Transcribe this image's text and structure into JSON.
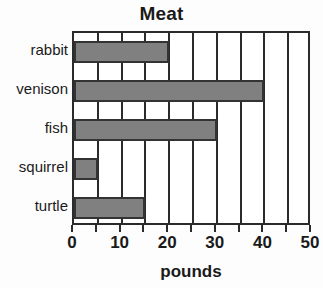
{
  "chart_data": {
    "type": "bar",
    "orientation": "horizontal",
    "title": "Meat",
    "xlabel": "pounds",
    "ylabel": "",
    "categories": [
      "rabbit",
      "venison",
      "fish",
      "squirrel",
      "turtle"
    ],
    "values": [
      20,
      40,
      30,
      5,
      15
    ],
    "xlim": [
      0,
      50
    ],
    "xticks": [
      0,
      10,
      20,
      30,
      40,
      50
    ],
    "xtick_labels": [
      "0",
      "10",
      "20",
      "30",
      "40",
      "50"
    ],
    "minor_tick_step": 5,
    "gridlines": [
      0,
      5,
      10,
      15,
      20,
      25,
      30,
      35,
      40,
      45,
      50
    ],
    "grid": true,
    "legend": null,
    "bar_color": "#808080",
    "bar_edge_color": "#333333",
    "axis_color": "#2b2b2b",
    "background_color": "#ffffff"
  }
}
